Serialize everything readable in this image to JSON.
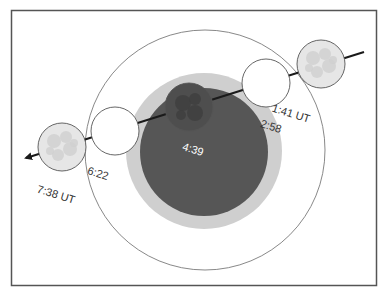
{
  "diagram": {
    "type": "lunar-eclipse-path",
    "colors": {
      "frame": "#555555",
      "penumbra_outline": "#7a7a7a",
      "penumbra_inner_ring": "#cfcfcf",
      "umbra": "#565656",
      "path_line": "#1a1a1a",
      "moon_full": "#e6e6e6",
      "moon_eclipsed": "#4e4e4e",
      "label_dark": "#333333",
      "label_light": "#ffffff"
    },
    "shadows": {
      "penumbra": {
        "cx": 205,
        "cy": 150,
        "r": 120
      },
      "penumbra_dense": {
        "cx": 204,
        "cy": 151,
        "r": 78
      },
      "umbra": {
        "cx": 204,
        "cy": 152,
        "r": 64
      }
    },
    "path": {
      "x1": 364,
      "y1": 52,
      "x2": 20,
      "y2": 160
    },
    "moons": [
      {
        "id": "moon-1",
        "time": "1:41 UT",
        "cx": 321,
        "cy": 64,
        "r": 24,
        "state": "full",
        "label_x": 290,
        "label_y": 117,
        "label_color": "dark"
      },
      {
        "id": "moon-2",
        "time": "2:58",
        "cx": 266,
        "cy": 83,
        "r": 24,
        "state": "outline",
        "label_x": 270,
        "label_y": 130,
        "label_color": "dark"
      },
      {
        "id": "moon-3",
        "time": "4:39",
        "cx": 189,
        "cy": 107,
        "r": 24,
        "state": "eclipsed",
        "label_x": 192,
        "label_y": 153,
        "label_color": "light"
      },
      {
        "id": "moon-4",
        "time": "6:22",
        "cx": 115,
        "cy": 131,
        "r": 24,
        "state": "outline",
        "label_x": 97,
        "label_y": 177,
        "label_color": "dark"
      },
      {
        "id": "moon-5",
        "time": "7:38 UT",
        "cx": 62,
        "cy": 147,
        "r": 24,
        "state": "full",
        "label_x": 55,
        "label_y": 198,
        "label_color": "dark"
      }
    ]
  }
}
